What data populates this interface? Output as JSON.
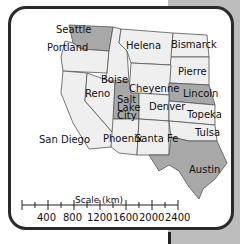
{
  "map": {
    "region": "Western United States",
    "colors": {
      "highlighted_state": "#a8a8a8",
      "normal_state": "#efefef",
      "border": "#555555",
      "background_panel": "#bdbdbd",
      "card_border": "#2a2a2a"
    },
    "cities": [
      {
        "name": "Seattle",
        "highlighted": true
      },
      {
        "name": "Portland",
        "highlighted": true
      },
      {
        "name": "Helena",
        "highlighted": false
      },
      {
        "name": "Bismarck",
        "highlighted": false
      },
      {
        "name": "Boise",
        "highlighted": false
      },
      {
        "name": "Pierre",
        "highlighted": false
      },
      {
        "name": "Reno",
        "highlighted": false
      },
      {
        "name": "Cheyenne",
        "highlighted": false
      },
      {
        "name": "Lincoln",
        "highlighted": true
      },
      {
        "name": "Salt Lake City",
        "highlighted": true
      },
      {
        "name": "Denver",
        "highlighted": false
      },
      {
        "name": "Topeka",
        "highlighted": false
      },
      {
        "name": "San Diego",
        "highlighted": false
      },
      {
        "name": "Phoenix",
        "highlighted": false
      },
      {
        "name": "Santa Fe",
        "highlighted": false
      },
      {
        "name": "Tulsa",
        "highlighted": false
      },
      {
        "name": "Austin",
        "highlighted": true
      }
    ]
  },
  "labels": {
    "seattle": "Seattle",
    "portland": "Portland",
    "helena": "Helena",
    "bismarck": "Bismarck",
    "boise": "Boise",
    "pierre": "Pierre",
    "reno": "Reno",
    "cheyenne": "Cheyenne",
    "lincoln": "Lincoln",
    "salt": "Salt",
    "lake": "Lake",
    "city": "City",
    "denver": "Denver",
    "topeka": "Topeka",
    "san_diego": "San Diego",
    "phoenix": "Phoenix",
    "santa_fe": "Santa Fe",
    "tulsa": "Tulsa",
    "austin": "Austin"
  },
  "scale": {
    "title": "Scale (km)",
    "ticks": [
      "400",
      "800",
      "1200",
      "1600",
      "2000",
      "2400"
    ]
  }
}
